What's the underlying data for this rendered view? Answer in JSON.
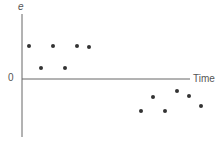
{
  "chart_data": {
    "type": "scatter",
    "title": "",
    "xlabel": "Time",
    "ylabel": "e",
    "y_tick_labels": [
      "0"
    ],
    "grid": false,
    "legend": null,
    "x": [
      1,
      2,
      3,
      4,
      5,
      6,
      7,
      8,
      9,
      10,
      11,
      12
    ],
    "y": [
      1.0,
      0.3,
      1.0,
      0.3,
      1.0,
      0.95,
      -1.0,
      -0.55,
      -1.0,
      -0.35,
      -0.5,
      -0.85
    ],
    "ylim": [
      -1.8,
      1.8
    ],
    "pixel_points": [
      [
        29,
        46
      ],
      [
        41,
        68
      ],
      [
        53,
        46
      ],
      [
        65,
        68
      ],
      [
        77,
        46
      ],
      [
        89,
        47
      ],
      [
        141,
        111
      ],
      [
        153,
        97
      ],
      [
        165,
        111
      ],
      [
        177,
        91
      ],
      [
        189,
        96
      ],
      [
        201,
        106
      ]
    ],
    "color": "#333333"
  },
  "labels": {
    "y": "e",
    "zero": "0",
    "x": "Time"
  }
}
